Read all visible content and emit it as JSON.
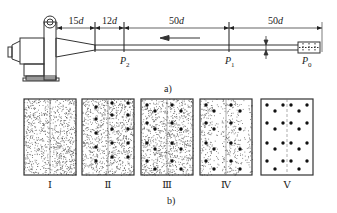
{
  "figure": {
    "part_a": {
      "caption": "a)",
      "dimensions": [
        {
          "label_num": "15",
          "label_var": "d",
          "x1": 57,
          "x2": 95
        },
        {
          "label_num": "12",
          "label_var": "d",
          "x1": 95,
          "x2": 124
        },
        {
          "label_num": "50",
          "label_var": "d",
          "x1": 124,
          "x2": 229
        },
        {
          "label_num": "50",
          "label_var": "d",
          "x1": 229,
          "x2": 322
        }
      ],
      "points": [
        {
          "name": "P",
          "sub": "2",
          "x": 124
        },
        {
          "name": "P",
          "sub": "1",
          "x": 229
        },
        {
          "name": "P",
          "sub": "0",
          "x": 306
        }
      ],
      "flow_arrow": "arrow-left"
    },
    "part_b": {
      "caption": "b)",
      "panels": [
        {
          "label": "Ⅰ",
          "speckle": "full",
          "dots": false
        },
        {
          "label": "Ⅱ",
          "speckle": "full",
          "dots": true
        },
        {
          "label": "Ⅲ",
          "speckle": "full",
          "dots": true
        },
        {
          "label": "Ⅳ",
          "speckle": "partial",
          "dots": true
        },
        {
          "label": "Ⅴ",
          "speckle": "none",
          "dots": true
        }
      ]
    },
    "colors": {
      "ink": "#222222",
      "speckle": "#555555",
      "frame": "#333333"
    }
  }
}
